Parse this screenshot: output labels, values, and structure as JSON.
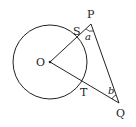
{
  "diagram": {
    "points": {
      "O": {
        "label": "O",
        "x": 50,
        "y": 62
      },
      "P": {
        "label": "P",
        "x": 91,
        "y": 24
      },
      "Q": {
        "label": "Q",
        "x": 119,
        "y": 103
      },
      "S": {
        "label": "S",
        "x": 77,
        "y": 37
      },
      "T": {
        "label": "T",
        "x": 82,
        "y": 80
      }
    },
    "circle": {
      "center": "O",
      "radius": 37
    },
    "angles": {
      "a": {
        "label": "a",
        "vertex": "P"
      },
      "b": {
        "label": "b",
        "vertex": "Q"
      }
    },
    "colors": {
      "stroke": "#222222",
      "background": "#ffffff"
    }
  }
}
